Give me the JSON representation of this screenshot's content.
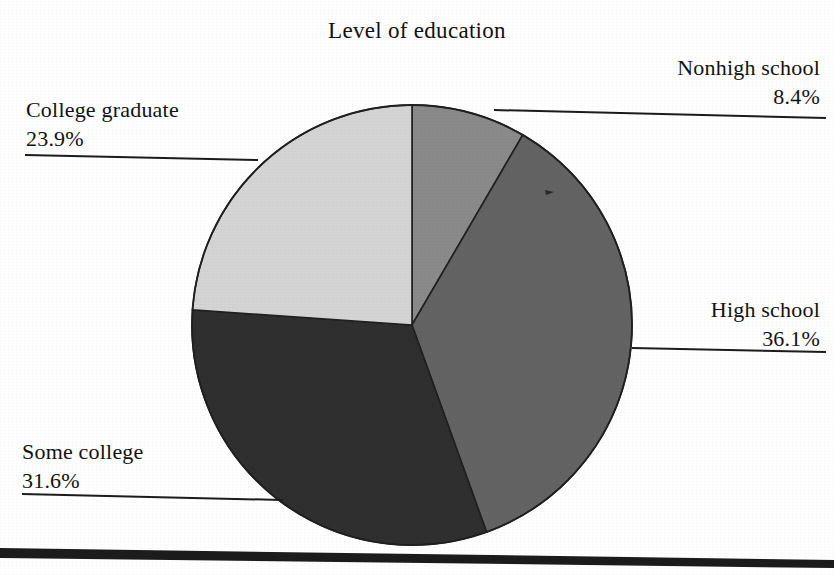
{
  "chart_data": {
    "type": "pie",
    "title": "Level of education",
    "xlabel": "",
    "ylabel": "",
    "legend_position": "callout-labels",
    "grid": false,
    "start_angle_deg": 0,
    "direction": "clockwise",
    "categories": [
      "Nonhigh school",
      "High school",
      "Some college",
      "College graduate"
    ],
    "values": [
      8.4,
      36.1,
      31.6,
      23.9
    ],
    "value_labels": [
      "8.4%",
      "36.1%",
      "31.6%",
      "23.9%"
    ],
    "units": "percent",
    "slice_colors": [
      "#8a8a8a",
      "#636363",
      "#2f2f2f",
      "#d4d4d4"
    ],
    "slices": [
      {
        "label": "Nonhigh school",
        "value": 8.4,
        "value_label": "8.4%",
        "color": "#8a8a8a"
      },
      {
        "label": "High school",
        "value": 36.1,
        "value_label": "36.1%",
        "color": "#636363"
      },
      {
        "label": "Some college",
        "value": 31.6,
        "value_label": "31.6%",
        "color": "#2f2f2f"
      },
      {
        "label": "College graduate",
        "value": 23.9,
        "value_label": "23.9%",
        "color": "#d4d4d4"
      }
    ]
  },
  "figure": {
    "title": "Level of education",
    "callouts": {
      "nonhigh_school": {
        "name": "Nonhigh school",
        "pct": "8.4%"
      },
      "high_school": {
        "name": "High school",
        "pct": "36.1%"
      },
      "some_college": {
        "name": "Some college",
        "pct": "31.6%"
      },
      "college_graduate": {
        "name": "College graduate",
        "pct": "23.9%"
      }
    }
  },
  "style": {
    "page_background": "#ffffff",
    "ink": "#121212",
    "rule_color": "#1c1c1c",
    "outline_color": "#202020"
  }
}
